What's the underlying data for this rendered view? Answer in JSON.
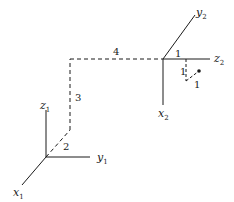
{
  "diagram": {
    "frame1": {
      "origin": [
        46,
        157
      ],
      "axes": [
        {
          "name": "z",
          "sub": "1",
          "end": [
            46,
            110
          ],
          "label_pos": [
            40,
            105
          ]
        },
        {
          "name": "y",
          "sub": "1",
          "end": [
            90,
            157
          ],
          "label_pos": [
            97,
            160
          ]
        },
        {
          "name": "x",
          "sub": "1",
          "end": [
            22,
            185
          ],
          "label_pos": [
            13,
            197
          ]
        }
      ]
    },
    "frame2": {
      "origin": [
        163,
        59
      ],
      "axes": [
        {
          "name": "y",
          "sub": "2",
          "end": [
            195,
            15
          ],
          "label_pos": [
            196,
            14
          ]
        },
        {
          "name": "z",
          "sub": "2",
          "end": [
            210,
            59
          ],
          "label_pos": [
            214,
            63
          ]
        },
        {
          "name": "x",
          "sub": "2",
          "end": [
            163,
            105
          ],
          "label_pos": [
            158,
            118
          ]
        }
      ]
    },
    "translation_path": {
      "segments": [
        {
          "from": [
            46,
            157
          ],
          "to": [
            70,
            130
          ],
          "label": "2",
          "label_pos": [
            63,
            150
          ]
        },
        {
          "from": [
            70,
            130
          ],
          "to": [
            70,
            59
          ],
          "label": "3",
          "label_pos": [
            75,
            101
          ]
        },
        {
          "from": [
            70,
            59
          ],
          "to": [
            163,
            59
          ],
          "label": "4",
          "label_pos": [
            113,
            55
          ]
        }
      ]
    },
    "point_path": {
      "along_z2": {
        "label": "1",
        "label_pos": [
          175,
          55
        ]
      },
      "segments": [
        {
          "from": [
            186,
            59
          ],
          "to": [
            186,
            81
          ],
          "label": "1",
          "label_pos": [
            180,
            75
          ]
        },
        {
          "from": [
            186,
            81
          ],
          "to": [
            199,
            71
          ],
          "label": "1",
          "label_pos": [
            194,
            88
          ]
        }
      ],
      "point": [
        199,
        71
      ]
    },
    "colors": {
      "line": "#1a1a1a",
      "background": "#ffffff"
    }
  }
}
